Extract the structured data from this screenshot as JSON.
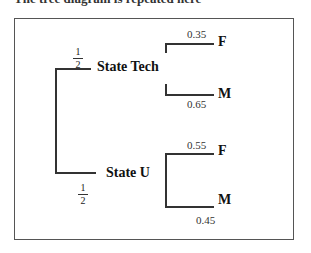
{
  "caption": "The tree diagram is repeated here",
  "tree": {
    "root_branches": [
      {
        "label": "State Tech",
        "probability": {
          "numerator": "1",
          "denominator": "2"
        },
        "children": [
          {
            "label": "F",
            "probability": "0.35"
          },
          {
            "label": "M",
            "probability": "0.65"
          }
        ]
      },
      {
        "label": "State U",
        "probability": {
          "numerator": "1",
          "denominator": "2"
        },
        "children": [
          {
            "label": "F",
            "probability": "0.55"
          },
          {
            "label": "M",
            "probability": "0.45"
          }
        ]
      }
    ]
  }
}
